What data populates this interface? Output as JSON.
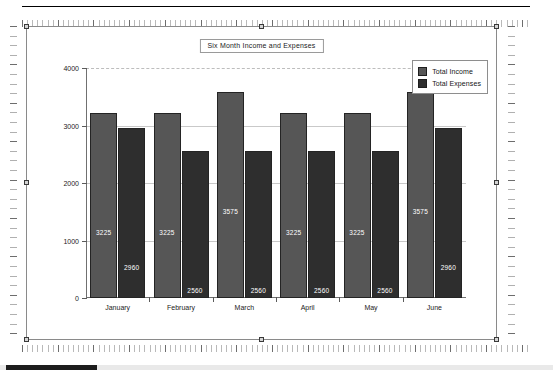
{
  "chart_data": {
    "type": "bar",
    "title": "Six Month Income and Expenses",
    "xlabel": "",
    "ylabel": "",
    "ylim": [
      0,
      4000
    ],
    "yticks": [
      0,
      1000,
      2000,
      3000,
      4000
    ],
    "ytick_labels": [
      "0",
      "1000",
      "2000",
      "3000",
      "4000"
    ],
    "grid": true,
    "legend_position": "top-right",
    "categories": [
      "January",
      "February",
      "March",
      "April",
      "May",
      "June"
    ],
    "series": [
      {
        "name": "Total Income",
        "color": "#565656",
        "values": [
          3225,
          3225,
          3575,
          3225,
          3225,
          3575
        ],
        "labels": [
          "3225",
          "3225",
          "3575",
          "3225",
          "3225",
          "3575"
        ]
      },
      {
        "name": "Total Expenses",
        "color": "#2e2e2e",
        "values": [
          2960,
          2560,
          2560,
          2560,
          2560,
          2960
        ],
        "labels": [
          "2960",
          "2560",
          "2560",
          "2560",
          "2560",
          "2960"
        ]
      }
    ]
  },
  "colors": {
    "income": "#565656",
    "expenses": "#2e2e2e",
    "bar_outline": "#242424",
    "gridline": "#c9c9c9",
    "axis": "#707070",
    "frame": "#8a8a8a",
    "value_label": "#ffffff",
    "scrollbar_thumb": "#1d1d1d"
  },
  "icons": {
    "income_swatch": "legend-swatch-icon",
    "expenses_swatch": "legend-swatch-icon",
    "selection_handle": "resize-handle-icon"
  }
}
